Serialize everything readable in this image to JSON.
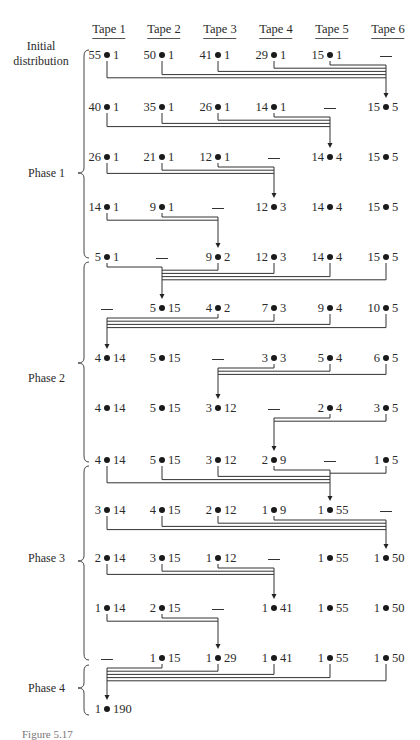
{
  "columns": {
    "headers": [
      "Tape 1",
      "Tape 2",
      "Tape 3",
      "Tape 4",
      "Tape 5",
      "Tape 6"
    ],
    "x": [
      107,
      162,
      218,
      274,
      330,
      386
    ]
  },
  "phases": [
    {
      "label": "Initial distribution",
      "label_lines": [
        "Initial",
        "distribution"
      ],
      "y": 48
    },
    {
      "label": "Phase 1",
      "y": 168
    },
    {
      "label": "Phase 2",
      "y": 373
    },
    {
      "label": "Phase 3",
      "y": 553
    },
    {
      "label": "Phase 4",
      "y": 683
    }
  ],
  "rows": [
    {
      "y": 55,
      "cells": [
        "55 • 1",
        "50 • 1",
        "41 • 1",
        "29 • 1",
        "15 • 1",
        "—"
      ]
    },
    {
      "y": 107,
      "cells": [
        "40 • 1",
        "35 • 1",
        "26 • 1",
        "14 • 1",
        "—",
        "15 • 5"
      ]
    },
    {
      "y": 157,
      "cells": [
        "26 • 1",
        "21 • 1",
        "12 • 1",
        "—",
        "14 • 4",
        "15 • 5"
      ]
    },
    {
      "y": 207,
      "cells": [
        "14 • 1",
        "9 • 1",
        "—",
        "12 • 3",
        "14 • 4",
        "15 • 5"
      ]
    },
    {
      "y": 257,
      "cells": [
        "5 • 1",
        "—",
        "9 • 2",
        "12 • 3",
        "14 • 4",
        "15 • 5"
      ]
    },
    {
      "y": 308,
      "cells": [
        "—",
        "5 • 15",
        "4 • 2",
        "7 • 3",
        "9 • 4",
        "10 • 5"
      ]
    },
    {
      "y": 358,
      "cells": [
        "4 • 14",
        "5 • 15",
        "—",
        "3 • 3",
        "5 • 4",
        "6 • 5"
      ]
    },
    {
      "y": 408,
      "cells": [
        "4 • 14",
        "5 • 15",
        "3 • 12",
        "—",
        "2 • 4",
        "3 • 5"
      ]
    },
    {
      "y": 460,
      "cells": [
        "4 • 14",
        "5 • 15",
        "3 • 12",
        "2 • 9",
        "—",
        "1 • 5"
      ]
    },
    {
      "y": 510,
      "cells": [
        "3 • 14",
        "4 • 15",
        "2 • 12",
        "1 • 9",
        "1 • 55",
        "—"
      ]
    },
    {
      "y": 558,
      "cells": [
        "2 • 14",
        "3 • 15",
        "1 • 12",
        "—",
        "1 • 55",
        "1 • 50"
      ]
    },
    {
      "y": 608,
      "cells": [
        "1 • 14",
        "2 • 15",
        "—",
        "1 • 41",
        "1 • 55",
        "1 • 50"
      ]
    },
    {
      "y": 658,
      "cells": [
        "—",
        "1 • 15",
        "1 • 29",
        "1 • 41",
        "1 • 55",
        "1 • 50"
      ]
    },
    {
      "y": 709,
      "cells": [
        "1 • 190",
        "",
        "",
        "",
        "",
        ""
      ]
    }
  ],
  "merges": [
    {
      "from_row": 0,
      "sources": [
        0,
        1,
        2,
        3,
        4
      ],
      "target": 5
    },
    {
      "from_row": 1,
      "sources": [
        0,
        1,
        2,
        3
      ],
      "target": 4
    },
    {
      "from_row": 2,
      "sources": [
        0,
        1,
        2
      ],
      "target": 3
    },
    {
      "from_row": 3,
      "sources": [
        0,
        1
      ],
      "target": 2
    },
    {
      "from_row": 4,
      "sources": [
        0,
        2,
        3,
        4,
        5
      ],
      "target": 1
    },
    {
      "from_row": 5,
      "sources": [
        2,
        3,
        4,
        5
      ],
      "target": 0
    },
    {
      "from_row": 6,
      "sources": [
        3,
        4,
        5
      ],
      "target": 2
    },
    {
      "from_row": 7,
      "sources": [
        4,
        5
      ],
      "target": 3
    },
    {
      "from_row": 8,
      "sources": [
        0,
        1,
        2,
        3,
        5
      ],
      "target": 4
    },
    {
      "from_row": 9,
      "sources": [
        0,
        1,
        2,
        3
      ],
      "target": 5
    },
    {
      "from_row": 10,
      "sources": [
        0,
        1,
        2
      ],
      "target": 3
    },
    {
      "from_row": 11,
      "sources": [
        0,
        1
      ],
      "target": 2
    },
    {
      "from_row": 12,
      "sources": [
        1,
        2,
        3,
        4,
        5
      ],
      "target": 0
    }
  ],
  "braces": [
    {
      "name": "phase-1",
      "top": 50,
      "mid": 173,
      "bottom": 258
    },
    {
      "name": "phase-2",
      "top": 262,
      "mid": 363,
      "bottom": 462
    },
    {
      "name": "phase-3",
      "top": 466,
      "mid": 561,
      "bottom": 660
    },
    {
      "name": "phase-4",
      "top": 665,
      "mid": 688,
      "bottom": 715
    }
  ],
  "caption": "Figure 5.17"
}
